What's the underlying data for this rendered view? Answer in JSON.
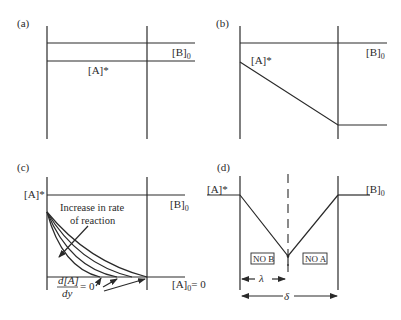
{
  "figure": {
    "panels": [
      {
        "id": "a",
        "label": "(a)",
        "labels": {
          "A_star": "[A]*",
          "B0": "[B]",
          "B0_sub": "0"
        },
        "description": "Constant [A]* and [B]0 levels across film"
      },
      {
        "id": "b",
        "label": "(b)",
        "labels": {
          "A_star": "[A]*",
          "B0": "[B]",
          "B0_sub": "0"
        },
        "description": "[A] decreases linearly across film; [B]0 constant"
      },
      {
        "id": "c",
        "label": "(c)",
        "labels": {
          "A_star": "[A]*",
          "B0": "[B]",
          "B0_sub": "0",
          "A0": "[A]",
          "A0_sub": "0",
          "A0_eq": "= 0",
          "annotation_line1": "Increase in rate",
          "annotation_line2": "of reaction",
          "deriv_num": "d[A]",
          "deriv_den": "dy",
          "deriv_eq": "= 0"
        },
        "curve_count": 4,
        "description": "Concentration profiles for increasing reaction rate"
      },
      {
        "id": "d",
        "label": "(d)",
        "labels": {
          "A_star": "[A]*",
          "B0": "[B]",
          "B0_sub": "0",
          "no_b": "NO B",
          "no_a": "NO A",
          "lambda": "λ",
          "delta": "δ"
        },
        "description": "Instantaneous reaction with reaction plane at λ within film thickness δ"
      }
    ]
  }
}
